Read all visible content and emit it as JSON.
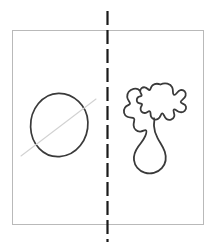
{
  "figure": {
    "background_color": "#ffffff",
    "width": 214,
    "height": 249
  },
  "frame": {
    "name": "figure-border",
    "x": 12,
    "y": 30,
    "width": 191,
    "height": 194,
    "stroke_color": "#b9b9b9",
    "stroke_width": 1,
    "fill": "none"
  },
  "divider": {
    "name": "dashed-axis-line",
    "orientation": "vertical",
    "x": 107.5,
    "y_start": 11,
    "y_end": 242,
    "stroke_color": "#1a1a1a",
    "stroke_width": 2.2,
    "dash_length": 14,
    "gap_length": 5,
    "dash_array": "14 5"
  },
  "shapes": [
    {
      "name": "circle-shape",
      "side": "left",
      "kind": "circle",
      "center_x": 59,
      "center_y": 125,
      "radius_x": 28.5,
      "radius_y": 31.5,
      "stroke_color": "#3a3a3a",
      "stroke_width": 1.7,
      "fill": "none",
      "path": "M 58.5 93.3 C 73.2 93.0 87.4 105.6 87.9 122.0 C 88.5 139.8 76.5 155.5 59.6 156.6 C 43.6 157.6 31.1 144.0 30.6 126.9 C 30.1 109.2 42.6 93.6 58.5 93.3 Z"
    },
    {
      "name": "faint-diagonal-line",
      "side": "left",
      "kind": "line",
      "x1": 21,
      "y1": 156,
      "x2": 96,
      "y2": 99,
      "stroke_color": "#d2d2d2",
      "stroke_width": 1.1,
      "fill": "none"
    },
    {
      "name": "irregular-blob-shape",
      "side": "right",
      "kind": "closed-freeform-curve",
      "bounds_x": 124,
      "bounds_y": 83,
      "bounds_width": 62,
      "bounds_height": 92,
      "stroke_color": "#3a3a3a",
      "stroke_width": 1.8,
      "fill": "none",
      "path": "M 160.5 84.5 C 165.0 82.3 170.5 83.6 172.2 87.4 C 173.8 90.9 172.1 94.0 173.8 94.8 C 176.0 95.8 177.2 91.0 180.4 90.2 C 184.0 89.3 186.5 92.4 185.6 95.8 C 184.8 99.0 180.6 100.2 180.7 102.0 C 180.8 103.8 185.2 103.5 186.0 106.6 C 186.8 109.9 183.6 112.6 180.3 112.2 C 177.2 111.8 175.4 108.6 173.9 109.5 C 172.3 110.5 175.1 113.3 174.2 116.4 C 173.3 119.6 169.2 120.9 166.5 119.0 C 163.9 117.2 164.0 113.6 162.4 113.4 C 160.7 113.2 160.9 117.0 158.2 118.8 C 155.6 120.5 152.4 119.3 151.2 116.9 C 150.0 114.6 151.1 112.2 149.9 111.4 C 148.5 110.5 147.0 113.0 144.6 113.0 C 142.0 113.0 140.3 110.8 140.6 108.3 C 140.8 106.3 142.4 105.3 142.0 104.2 C 141.5 103.0 139.5 104.0 138.0 102.8 C 136.3 101.4 136.4 98.7 138.0 97.3 C 139.4 96.1 141.2 96.6 141.6 95.6 C 142.1 94.4 140.2 93.4 140.2 91.2 C 140.2 88.7 142.4 86.9 144.8 87.3 C 147.2 87.7 148.3 90.2 149.6 90.0 C 151.0 89.8 150.4 86.8 152.6 85.2 C 155.0 83.4 158.2 83.6 160.5 84.5 Z M 140.2 91.2 C 139.0 89.3 136.2 88.2 133.5 88.8 C 129.6 89.6 126.8 93.2 127.2 97.0 C 127.5 100.3 130.2 102.0 130.0 103.6 C 129.8 105.2 126.8 105.0 124.9 107.8 C 122.8 110.9 124.0 115.2 127.3 116.8 C 130.0 118.1 132.6 117.1 133.9 118.3 C 135.3 119.6 133.4 122.0 133.6 125.2 C 133.8 129.0 136.8 131.8 140.3 131.6 C 143.0 131.4 144.6 129.6 145.8 130.2 C 147.0 130.8 146.4 133.2 145.2 136.2 C 143.6 140.2 140.8 143.0 138.3 146.6 C 135.4 150.7 133.4 155.4 134.0 160.2 C 134.7 166.0 139.0 170.8 144.6 172.6 C 150.6 174.5 157.6 172.9 161.8 168.2 C 165.8 163.8 166.6 157.4 164.8 151.8 C 163.2 146.8 160.0 142.8 157.6 138.2 C 155.6 134.4 154.2 130.2 154.0 126.0 C 153.8 122.0 155.0 119.8 154.0 118.2"
    }
  ]
}
